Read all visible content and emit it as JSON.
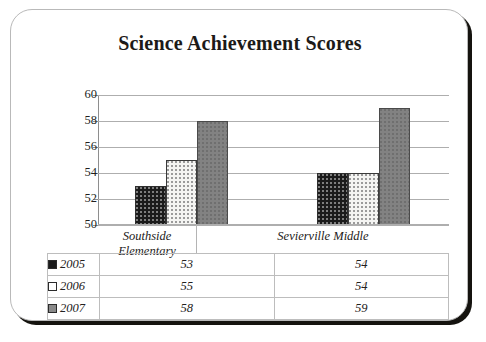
{
  "card": {
    "title": "Science Achievement Scores"
  },
  "chart_data": {
    "type": "bar",
    "title": "Science Achievement Scores",
    "xlabel": "",
    "ylabel": "",
    "ylim": [
      50,
      60
    ],
    "yticks": [
      50,
      52,
      54,
      56,
      58,
      60
    ],
    "grid": true,
    "legend_position": "table-below",
    "categories": [
      "Southside Elementary",
      "Sevierville Middle"
    ],
    "series": [
      {
        "name": "2005",
        "color": "#1b1b1b",
        "values": [
          53,
          54
        ]
      },
      {
        "name": "2006",
        "color": "#ffffff",
        "values": [
          55,
          54
        ]
      },
      {
        "name": "2007",
        "color": "#8a8a8a",
        "values": [
          58,
          59
        ]
      }
    ]
  },
  "table": {
    "row_labels": [
      "2005",
      "2006",
      "2007"
    ],
    "column_headers": [
      "Southside Elementary",
      "Sevierville Middle"
    ],
    "rows": [
      {
        "label": "2005",
        "values": [
          "53",
          "54"
        ]
      },
      {
        "label": "2006",
        "values": [
          "55",
          "54"
        ]
      },
      {
        "label": "2007",
        "values": [
          "58",
          "59"
        ]
      }
    ]
  }
}
